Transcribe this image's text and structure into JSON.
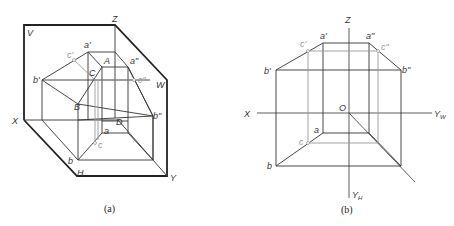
{
  "figure_a": {
    "caption": "(a)",
    "planes": {
      "V": "V",
      "W": "W",
      "H": "H"
    },
    "axes": {
      "X": "X",
      "Y": "Y",
      "Z": "Z"
    },
    "points": {
      "a_prime": "a'",
      "b_prime": "b'",
      "c_prime": "c'",
      "a_dprime": "a\"",
      "b_dprime": "b\"",
      "c_dprime": "c\"",
      "A": "A",
      "B": "B",
      "C": "C",
      "D": "D",
      "a": "a",
      "b": "b",
      "c": "c"
    }
  },
  "figure_b": {
    "caption": "(b)",
    "axes": {
      "X": "X",
      "Z": "Z",
      "O": "O",
      "YW": "Y",
      "YW_sub": "W",
      "YH": "Y",
      "YH_sub": "H"
    },
    "points": {
      "a_prime": "a'",
      "b_prime": "b'",
      "c_prime": "c'",
      "a_dprime": "a\"",
      "b_dprime": "b\"",
      "c_dprime": "c\"",
      "a": "a",
      "b": "b",
      "c": "c"
    }
  },
  "colors": {
    "line": "#333333",
    "hidden_gray": "#9a9a9a"
  }
}
